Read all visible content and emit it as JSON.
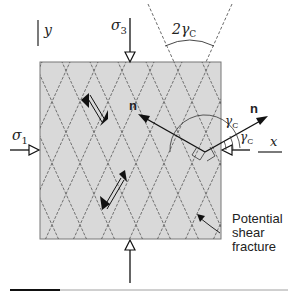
{
  "diagram": {
    "axis_y_label": "y",
    "axis_x_label": "x",
    "sigma3_label": "σ",
    "sigma3_sub": "3",
    "sigma1_label": "σ",
    "sigma1_sub": "1",
    "cone_angle_label": "2γ",
    "cone_angle_sub": "C",
    "normal_label_left": "n",
    "normal_label_right": "n",
    "angle_label_upper": "γ",
    "angle_label_upper_sub": "C",
    "angle_label_lower": "γ",
    "angle_label_lower_sub": "C",
    "annotation_lines": [
      "Potential",
      "shear",
      "fracture"
    ]
  },
  "colors": {
    "sample_fill": "#d9d9d9",
    "sample_border": "#777777",
    "line": "#1a1a1a",
    "dashed": "#444444"
  }
}
